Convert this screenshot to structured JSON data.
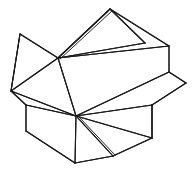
{
  "document": {
    "title": "Open cardboard box line drawing",
    "kind": "line-art-wireframe",
    "width": 193,
    "height": 175,
    "background_color": "#ffffff",
    "stroke_color": "#1a1a1a",
    "stroke_width": 1.1,
    "description": "Black-and-white polygonal wireframe sketch of an open box with folded-out flaps, drawn in thin outline strokes with no shading or text."
  },
  "figure": {
    "name": "open-box-wireframe",
    "vertices": {
      "hub_upper": [
        58,
        58
      ],
      "hub_lower": [
        76,
        116
      ],
      "box_top_left": [
        20,
        34
      ],
      "box_top_apex": [
        110,
        9
      ],
      "box_top_right": [
        169,
        46
      ],
      "flap_top_inner_right": [
        145,
        43
      ],
      "left_point": [
        11,
        91
      ],
      "left_lower_corner": [
        26,
        105
      ],
      "left_bottom_corner": [
        26,
        131
      ],
      "bottom_vertex": [
        75,
        163
      ],
      "bottom_notch": [
        113,
        156
      ],
      "right_flap_point": [
        186,
        83
      ],
      "right_lower_corner": [
        169,
        72
      ],
      "right_bottom_corner": [
        168,
        138
      ],
      "right_inner_corner": [
        152,
        105
      ],
      "top_ridge_right": [
        166,
        51
      ],
      "mid_right_edge": [
        120,
        92
      ]
    },
    "polylines": [
      {
        "name": "box-top-left-panel",
        "points": "20,34 58,58 110,9"
      },
      {
        "name": "box-upper-left-edge",
        "points": "20,34 11,91"
      },
      {
        "name": "left-point-to-hub",
        "points": "11,91 58,58"
      },
      {
        "name": "top-apex-right-edge",
        "points": "110,9 145,43"
      },
      {
        "name": "top-flap-inner-return",
        "points": "145,43 58,58"
      },
      {
        "name": "top-apex-to-box-corner",
        "points": "110,9 169,46"
      },
      {
        "name": "box-top-ridge",
        "points": "58,58 169,46"
      },
      {
        "name": "box-right-vertical-edge",
        "points": "169,46 169,72"
      },
      {
        "name": "right-flap-upper",
        "points": "169,72 186,83"
      },
      {
        "name": "right-flap-lower",
        "points": "186,83 152,105"
      },
      {
        "name": "box-front-top-edge",
        "points": "58,58 76,116"
      },
      {
        "name": "box-front-right-diagonal",
        "points": "169,72 76,116"
      },
      {
        "name": "hub-to-right-inner",
        "points": "76,116 152,105"
      },
      {
        "name": "right-inner-vertical",
        "points": "152,105 152,138"
      },
      {
        "name": "right-bottom-to-hub",
        "points": "152,138 76,116"
      },
      {
        "name": "hub-to-bottom-notch",
        "points": "76,116 113,156"
      },
      {
        "name": "notch-to-right-bottom",
        "points": "113,156 152,138"
      },
      {
        "name": "hub-to-bottom-vertex",
        "points": "76,116 75,163"
      },
      {
        "name": "bottom-vertex-to-notch",
        "points": "75,163 113,156"
      },
      {
        "name": "left-lower-to-hub",
        "points": "26,105 76,116"
      },
      {
        "name": "left-point-to-left-lower",
        "points": "11,91 26,105"
      },
      {
        "name": "left-lower-vertical",
        "points": "26,105 26,131"
      },
      {
        "name": "left-bottom-to-bottom-vertex",
        "points": "26,131 75,163"
      },
      {
        "name": "left-point-to-hub-lower",
        "points": "11,91 76,116"
      },
      {
        "name": "apex-double-line-inner",
        "points": "108,11 58,58"
      },
      {
        "name": "left-panel-diagonal",
        "points": "20,34 11,91"
      }
    ]
  },
  "annotations": {
    "visible_text": "",
    "labels": []
  }
}
